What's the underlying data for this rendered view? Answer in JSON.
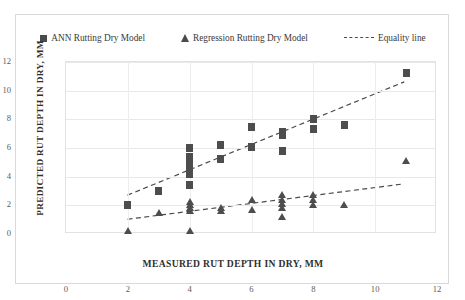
{
  "legend": {
    "items": [
      {
        "label": "ANN Rutting Dry Model",
        "marker": "square-marker"
      },
      {
        "label": "Regression Rutting Dry Model",
        "marker": "triangle-marker"
      },
      {
        "label": "Equality line",
        "marker": "dashed-line-marker"
      }
    ]
  },
  "axes": {
    "x_title": "MEASURED  RUT DEPTH IN DRY, MM",
    "y_title": "PREDICTED RUT DEPTH IN DRY, MM",
    "x_ticks": [
      "0",
      "2",
      "4",
      "6",
      "8",
      "10",
      "12"
    ],
    "y_ticks": [
      "0",
      "2",
      "4",
      "6",
      "8",
      "10",
      "12"
    ]
  },
  "colors": {
    "marker": "#4d4d4d",
    "trend": "#4a4a4a",
    "grid": "#e8e8e8",
    "frame": "#d9d9d9",
    "text": "#2f2f2f"
  },
  "chart_data": {
    "type": "scatter",
    "title": "",
    "xlabel": "MEASURED  RUT DEPTH IN DRY, MM",
    "ylabel": "PREDICTED RUT DEPTH IN DRY, MM",
    "xlim": [
      0,
      12
    ],
    "ylim": [
      0,
      12
    ],
    "xticks": [
      0,
      2,
      4,
      6,
      8,
      10,
      12
    ],
    "yticks": [
      0,
      2,
      4,
      6,
      8,
      10,
      12
    ],
    "grid": true,
    "legend_position": "top",
    "series": [
      {
        "name": "ANN Rutting Dry Model",
        "marker": "square",
        "points": [
          [
            2,
            2.0
          ],
          [
            3,
            3.0
          ],
          [
            4,
            4.2
          ],
          [
            4,
            4.6
          ],
          [
            4,
            5.0
          ],
          [
            4,
            5.4
          ],
          [
            4,
            6.0
          ],
          [
            4,
            3.4
          ],
          [
            5,
            5.2
          ],
          [
            5,
            6.2
          ],
          [
            6,
            6.1
          ],
          [
            6,
            7.5
          ],
          [
            7,
            5.8
          ],
          [
            7,
            6.9
          ],
          [
            7,
            7.1
          ],
          [
            8,
            7.3
          ],
          [
            8,
            8.0
          ],
          [
            9,
            7.6
          ],
          [
            11,
            11.2
          ]
        ]
      },
      {
        "name": "Regression Rutting Dry Model",
        "marker": "triangle",
        "points": [
          [
            2,
            0.2
          ],
          [
            3,
            1.5
          ],
          [
            4,
            0.2
          ],
          [
            4,
            1.6
          ],
          [
            4,
            1.8
          ],
          [
            4,
            2.0
          ],
          [
            4,
            2.2
          ],
          [
            5,
            1.6
          ],
          [
            5,
            1.8
          ],
          [
            6,
            1.7
          ],
          [
            6,
            2.4
          ],
          [
            7,
            1.2
          ],
          [
            7,
            1.8
          ],
          [
            7,
            2.1
          ],
          [
            7,
            2.4
          ],
          [
            7,
            2.7
          ],
          [
            8,
            2.0
          ],
          [
            8,
            2.4
          ],
          [
            8,
            2.7
          ],
          [
            9,
            2.0
          ],
          [
            11,
            5.1
          ]
        ]
      }
    ],
    "trendlines": [
      {
        "name": "Equality line",
        "style": "dashed",
        "x0": 2,
        "y0": 2.6,
        "x1": 11,
        "y1": 10.6
      },
      {
        "name": "Regression trend",
        "style": "dashed",
        "x0": 2,
        "y0": 0.9,
        "x1": 11,
        "y1": 3.4
      }
    ]
  }
}
